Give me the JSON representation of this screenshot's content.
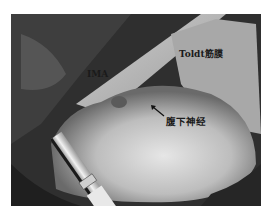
{
  "figure": {
    "labels": {
      "toldt": "Toldt筋膜",
      "ima": "IMA",
      "nerve": "腹下神经"
    },
    "colors": {
      "background": "#ffffff",
      "tissue_light": "#d8d8d8",
      "tissue_dark": "#2e2e2e",
      "label_text": "#1a1a1a"
    }
  }
}
